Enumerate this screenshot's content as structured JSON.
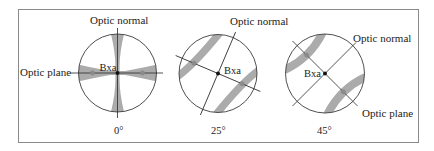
{
  "figure": {
    "type": "interference-figure-sequence",
    "colors": {
      "isogyre": "#ababab",
      "circle_outline": "#3a3a3a",
      "frame": "#8a8a8a",
      "melatope": "#8a8a8a",
      "bxa_point": "#111111"
    }
  },
  "panels": [
    {
      "angle_label": "0°",
      "optic_normal_label": "Optic normal",
      "optic_plane_label": "Optic plane",
      "bxa_label": "Bxa",
      "isogyre_shape": "cross"
    },
    {
      "angle_label": "25°",
      "optic_normal_label": "Optic normal",
      "bxa_label": "Bxa",
      "isogyre_shape": "hyperbolae"
    },
    {
      "angle_label": "45°",
      "optic_normal_label": "Optic normal",
      "optic_plane_label": "Optic plane",
      "bxa_label": "Bxa",
      "isogyre_shape": "hyperbolae"
    }
  ]
}
